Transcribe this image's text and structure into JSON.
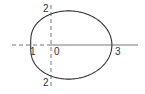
{
  "chart_data": {
    "type": "line",
    "title": "",
    "equation": "r = 2 + cos(theta)",
    "xlabel": "",
    "ylabel": "",
    "labels": {
      "left_x": "1",
      "origin": "0",
      "right_x": "3",
      "top_y": "2",
      "bottom_y": "2"
    },
    "key_points": [
      {
        "theta": "0",
        "x": 3,
        "y": 0
      },
      {
        "theta": "pi/2",
        "x": 0,
        "y": 2
      },
      {
        "theta": "pi",
        "x": -1,
        "y": 0
      },
      {
        "theta": "3pi/2",
        "x": 0,
        "y": -2
      }
    ],
    "xlim": [
      -2,
      4
    ],
    "ylim": [
      -2.5,
      2.5
    ],
    "grid": false,
    "legend": null
  },
  "colors": {
    "curve": "#333333",
    "axis": "#666666",
    "background": "#ffffff"
  }
}
